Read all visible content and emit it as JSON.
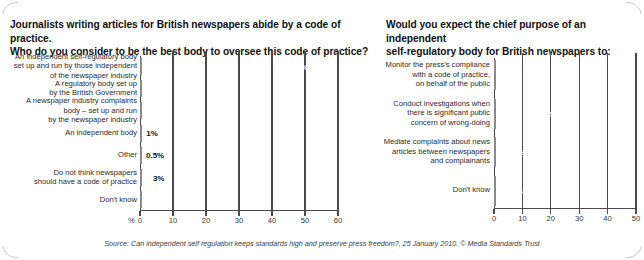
{
  "source_note": "Source: Can independent self regulation keeps standards high and preserve press freedom?, 25 January 2010. © Media Standards Trust",
  "left_panel": {
    "title_line1": "Journalists writing articles for British newspapers abide by a code of practice.",
    "title_line2": "Who do you consider to be the best body to oversee this code of practice?",
    "axis_unit": "%"
  },
  "right_panel": {
    "title_line1": "Would you expect the chief purpose of an independent",
    "title_line2": "self-regulatory body for British newspapers to:"
  },
  "chart_data": [
    {
      "id": "left-chart",
      "type": "bar",
      "orientation": "horizontal",
      "title": "Journalists writing articles for British newspapers abide by a code of practice. Who do you consider to be the best body to oversee this code of practice?",
      "xlabel": "%",
      "ylabel": "",
      "xlim": [
        0,
        60
      ],
      "xticks": [
        "0",
        "10",
        "20",
        "30",
        "40",
        "50",
        "60"
      ],
      "grid": true,
      "legend": "none",
      "categories": [
        "An independent self-regulatory body set up and run by those independent of the newspaper industry",
        "A regulatory body set up by the British Government",
        "A newspaper industry complaints body – set up and run by the newspaper industry",
        "An independent body",
        "Other",
        "Do not think newspapers should have a code of practice",
        "Don't know"
      ],
      "category_lines": [
        [
          "An independent self-regulatory body",
          "set up and run by those independent",
          "of the newspaper industry"
        ],
        [
          "A regulatory body set up",
          "by the British Government"
        ],
        [
          "A newspaper industry complaints",
          "body – set up and run",
          "by the newspaper industry"
        ],
        [
          "An independent body"
        ],
        [
          "Other"
        ],
        [
          "Do not think newspapers",
          "should have a code of practice"
        ],
        [
          "Don't know"
        ]
      ],
      "values": [
        52,
        17,
        8,
        1,
        0.5,
        3,
        19
      ],
      "value_labels": [
        "52%",
        "17%",
        "8%",
        "1%",
        "0.5%",
        "3%",
        "19%"
      ],
      "label_placement": [
        "inside",
        "inside",
        "inside",
        "outside",
        "outside",
        "outside",
        "inside"
      ]
    },
    {
      "id": "right-chart",
      "type": "bar",
      "orientation": "horizontal",
      "title": "Would you expect the chief purpose of an independent self-regulatory body for British newspapers to:",
      "xlabel": "",
      "ylabel": "",
      "xlim": [
        0,
        50
      ],
      "xticks": [
        "0",
        "10",
        "20",
        "30",
        "40",
        "50"
      ],
      "grid": true,
      "legend": "none",
      "categories": [
        "Monitor the press's compliance with a code of practice, on behalf of the public",
        "Conduct investigations when there is significant public concern of wrong-doing",
        "Mediate complaints about news articles between newspapers and complainants",
        "Don't know"
      ],
      "category_lines": [
        [
          "Monitor the press's compliance",
          "with a code of practice,",
          "on behalf of the public"
        ],
        [
          "Conduct investigations when",
          "there is significant public",
          "concern of wrong-doing"
        ],
        [
          "Mediate complaints about news",
          "articles between newspapers",
          "and complainants"
        ],
        [
          "Don't know"
        ]
      ],
      "values": [
        48,
        25,
        12,
        14
      ],
      "value_labels": [
        "48%",
        "25%",
        "12%",
        "14%"
      ],
      "label_placement": [
        "inside",
        "inside",
        "inside",
        "inside"
      ]
    }
  ]
}
